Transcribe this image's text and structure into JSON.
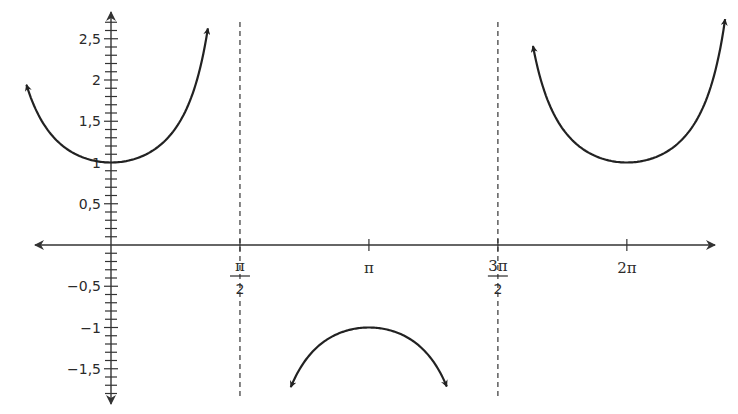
{
  "chart_data": {
    "type": "line",
    "title": "",
    "function": "y = sec(x)",
    "xlabel": "",
    "ylabel": "",
    "xlim": [
      -0.93,
      7.4
    ],
    "ylim": [
      -1.9,
      2.8
    ],
    "grid": false,
    "legend": null,
    "x_ticks": [
      {
        "value": 1.5708,
        "label_num": "π",
        "label_den": "2",
        "label": "π/2"
      },
      {
        "value": 3.1416,
        "label_num": "π",
        "label_den": "",
        "label": "π"
      },
      {
        "value": 4.7124,
        "label_num": "3π",
        "label_den": "2",
        "label": "3π/2"
      },
      {
        "value": 6.2832,
        "label_num": "2π",
        "label_den": "",
        "label": "2π"
      }
    ],
    "y_major_ticks": [
      {
        "value": 2.5,
        "label": "2,5"
      },
      {
        "value": 2,
        "label": "2"
      },
      {
        "value": 1.5,
        "label": "1,5"
      },
      {
        "value": 1,
        "label": "1"
      },
      {
        "value": 0.5,
        "label": "0,5"
      },
      {
        "value": -0.5,
        "label": "−0,5"
      },
      {
        "value": -1,
        "label": "−1"
      },
      {
        "value": -1.5,
        "label": "−1,5"
      }
    ],
    "y_minor_tick_step": 0.1,
    "asymptotes": [
      {
        "x": 1.5708,
        "label": "x = π/2",
        "style": "dashed"
      },
      {
        "x": 4.7124,
        "label": "x = 3π/2",
        "style": "dashed"
      }
    ],
    "series": [
      {
        "name": "sec branch 1",
        "x_range": [
          -1.03,
          1.18
        ],
        "vertex": [
          0,
          1
        ],
        "direction": "opens up"
      },
      {
        "name": "sec branch 2",
        "x_range": [
          2.19,
          4.09
        ],
        "vertex": [
          3.1416,
          -1
        ],
        "direction": "opens down"
      },
      {
        "name": "sec branch 3",
        "x_range": [
          5.14,
          7.48
        ],
        "vertex": [
          6.2832,
          1
        ],
        "direction": "opens up"
      }
    ],
    "colors": {
      "curve": "#222222",
      "axis": "#333333",
      "asymptote": "#444444"
    }
  }
}
